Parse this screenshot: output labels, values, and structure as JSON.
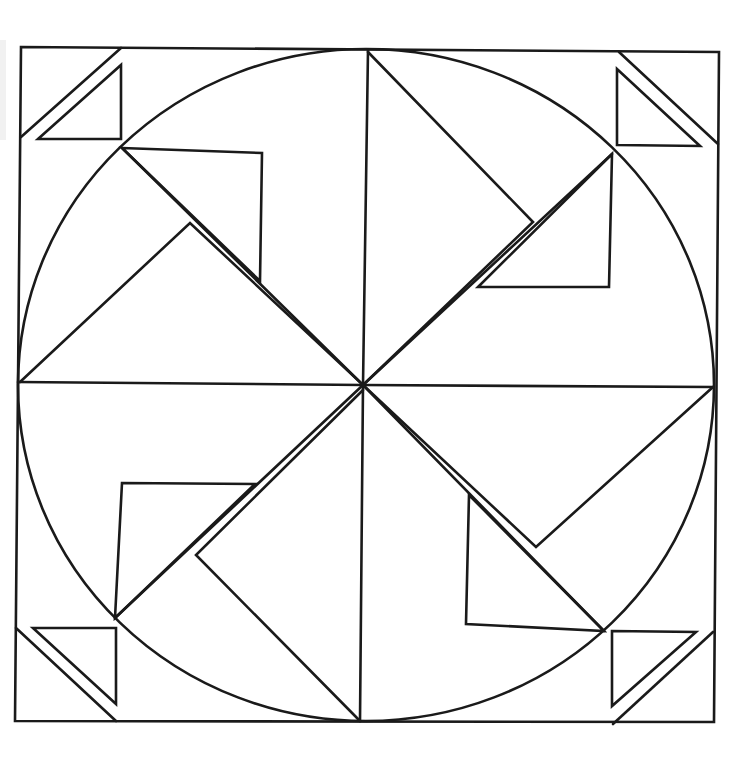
{
  "title": "",
  "drawing": {
    "kind": "geometric coloring page",
    "stroke_color": "#1a1a1a",
    "background": "#ffffff",
    "frame": {
      "points": "21,47 719,52 714,722 15,721"
    },
    "circle": {
      "cx": 366,
      "cy": 385,
      "rx": 348,
      "ry": 336
    },
    "center": {
      "x": 363,
      "y": 385
    },
    "corners": [
      {
        "name": "top-left",
        "diagonal": "21,137 121,48",
        "triangle": "38,139 121,65 121,139"
      },
      {
        "name": "top-right",
        "diagonal": "619,52 718,144",
        "triangle": "617,69 617,145 700,146"
      },
      {
        "name": "bottom-left",
        "diagonal": "16,628 116,721",
        "triangle": "33,628 116,628 116,704"
      },
      {
        "name": "bottom-right",
        "diagonal": "713,632 613,724",
        "triangle": "612,631 696,632 612,706"
      }
    ],
    "spokes": [
      {
        "name": "spoke-vertical-top",
        "points": "368,50 363,385"
      },
      {
        "name": "spoke-vertical-bottom",
        "points": "363,385 360,721"
      },
      {
        "name": "spoke-horizontal-left",
        "points": "18,382 363,385"
      },
      {
        "name": "spoke-horizontal-right",
        "points": "363,385 713,387"
      },
      {
        "name": "spoke-diag-tl",
        "points": "122,148 363,385"
      },
      {
        "name": "spoke-diag-tr",
        "points": "612,154 363,385"
      },
      {
        "name": "spoke-diag-bl",
        "points": "115,618 363,385"
      },
      {
        "name": "spoke-diag-br",
        "points": "604,631 363,385"
      }
    ],
    "blades": [
      {
        "name": "blade-top",
        "points": "368,52 533,222 363,385"
      },
      {
        "name": "blade-left",
        "points": "20,382 190,223 362,384"
      },
      {
        "name": "blade-right",
        "points": "713,387 536,547 363,385"
      },
      {
        "name": "blade-bottom",
        "points": "360,721 196,555 363,390"
      }
    ],
    "inner_triangles": [
      {
        "name": "triangle-upper-left",
        "points": "122,148 262,153 260,281"
      },
      {
        "name": "triangle-upper-right",
        "points": "612,154 478,287 609,287"
      },
      {
        "name": "triangle-lower-left",
        "points": "122,483 255,484 115,618"
      },
      {
        "name": "triangle-lower-right",
        "points": "469,495 466,624 604,631"
      }
    ]
  }
}
